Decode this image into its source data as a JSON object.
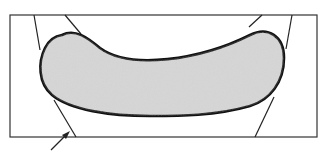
{
  "diagram": {
    "colors": {
      "background": "#ffffff",
      "stroke": "#1a1a1a",
      "fill": "#d4d4d4"
    },
    "labels": []
  }
}
